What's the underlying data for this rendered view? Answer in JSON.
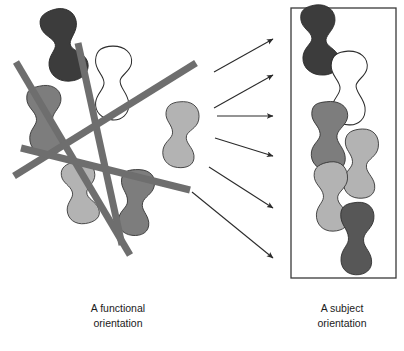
{
  "figure": {
    "type": "conceptual-diagram",
    "background_color": "#ffffff",
    "description_left": "Scattered organism shapes overlaid by crossing straight lines",
    "description_right": "Same organism shapes sorted into a single vertical column inside a rectangle"
  },
  "captions": {
    "left": {
      "line1": "A functional",
      "line2": "orientation"
    },
    "right": {
      "line1": "A subject",
      "line2": "orientation"
    }
  },
  "colors": {
    "shape_darkest": "#3c3c3c",
    "shape_dark": "#575757",
    "shape_medium": "#7d7d7d",
    "shape_light": "#b3b3b3",
    "shape_white_fill": "#ffffff",
    "shape_outline": "#2b2b2b",
    "line_gray": "#6e6e6e",
    "arrow_color": "#2b2b2b",
    "box_border": "#3a3a3a",
    "text_color": "#1a1a1a",
    "background": "#ffffff"
  },
  "left_panel": {
    "name": "functional-orientation-panel",
    "crossing_lines": [
      {
        "id": "line-1",
        "x1": 16,
        "y1": 62,
        "x2": 130,
        "y2": 255,
        "width": 7
      },
      {
        "id": "line-2",
        "x1": 78,
        "y1": 43,
        "x2": 122,
        "y2": 245,
        "width": 7
      },
      {
        "id": "line-3",
        "x1": 14,
        "y1": 176,
        "x2": 196,
        "y2": 63,
        "width": 7
      },
      {
        "id": "line-4",
        "x1": 21,
        "y1": 148,
        "x2": 190,
        "y2": 190,
        "width": 7
      }
    ],
    "shapes": [
      {
        "id": "shape-left-dark-top",
        "tone": "shape_darkest",
        "cx": 64,
        "cy": 45,
        "rot": -12,
        "sx": 1.05,
        "sy": 1.15,
        "variant": "blob-a"
      },
      {
        "id": "shape-left-white",
        "tone": "shape_white_fill",
        "cx": 112,
        "cy": 83,
        "rot": 4,
        "sx": 1.0,
        "sy": 1.15,
        "variant": "blob-b"
      },
      {
        "id": "shape-left-medium-mid",
        "tone": "shape_medium",
        "cx": 45,
        "cy": 120,
        "rot": -3,
        "sx": 0.95,
        "sy": 1.1,
        "variant": "blob-c"
      },
      {
        "id": "shape-left-light-right",
        "tone": "shape_light",
        "cx": 180,
        "cy": 134,
        "rot": 6,
        "sx": 0.95,
        "sy": 1.05,
        "variant": "blob-d"
      },
      {
        "id": "shape-left-light-bot",
        "tone": "shape_light",
        "cx": 80,
        "cy": 192,
        "rot": -8,
        "sx": 0.95,
        "sy": 1.0,
        "variant": "blob-d"
      },
      {
        "id": "shape-left-medium-bot",
        "tone": "shape_medium",
        "cx": 136,
        "cy": 202,
        "rot": 7,
        "sx": 0.95,
        "sy": 1.05,
        "variant": "blob-e"
      }
    ]
  },
  "arrows": {
    "name": "transformation-arrows",
    "count": 6,
    "items": [
      {
        "id": "arrow-1",
        "x1": 214,
        "y1": 72,
        "x2": 273,
        "y2": 39
      },
      {
        "id": "arrow-2",
        "x1": 214,
        "y1": 108,
        "x2": 273,
        "y2": 75
      },
      {
        "id": "arrow-3",
        "x1": 217,
        "y1": 116,
        "x2": 273,
        "y2": 116
      },
      {
        "id": "arrow-4",
        "x1": 215,
        "y1": 138,
        "x2": 273,
        "y2": 156
      },
      {
        "id": "arrow-5",
        "x1": 209,
        "y1": 167,
        "x2": 273,
        "y2": 208
      },
      {
        "id": "arrow-6",
        "x1": 192,
        "y1": 192,
        "x2": 273,
        "y2": 258
      }
    ]
  },
  "right_panel": {
    "name": "subject-orientation-panel",
    "box": {
      "x": 291,
      "y": 8,
      "width": 105,
      "height": 270,
      "stroke_width": 1.3
    },
    "shapes": [
      {
        "id": "shape-right-darkest",
        "tone": "shape_darkest",
        "cx": 320,
        "cy": 40,
        "rot": -3,
        "sx": 1.0,
        "sy": 1.1,
        "variant": "blob-a"
      },
      {
        "id": "shape-right-white",
        "tone": "shape_white_fill",
        "cx": 348,
        "cy": 88,
        "rot": 3,
        "sx": 1.0,
        "sy": 1.15,
        "variant": "blob-b"
      },
      {
        "id": "shape-right-medium",
        "tone": "shape_medium",
        "cx": 329,
        "cy": 136,
        "rot": 2,
        "sx": 1.0,
        "sy": 1.1,
        "variant": "blob-c"
      },
      {
        "id": "shape-right-light-1",
        "tone": "shape_light",
        "cx": 360,
        "cy": 163,
        "rot": 4,
        "sx": 0.95,
        "sy": 1.1,
        "variant": "blob-d"
      },
      {
        "id": "shape-right-light-2",
        "tone": "shape_light",
        "cx": 331,
        "cy": 196,
        "rot": -2,
        "sx": 0.95,
        "sy": 1.1,
        "variant": "blob-d"
      },
      {
        "id": "shape-right-dark",
        "tone": "shape_dark",
        "cx": 357,
        "cy": 238,
        "rot": 2,
        "sx": 0.95,
        "sy": 1.15,
        "variant": "blob-e"
      }
    ]
  },
  "caption_positions": {
    "left": {
      "x": 118,
      "y1": 312,
      "y2": 327
    },
    "right": {
      "x": 342,
      "y1": 312,
      "y2": 327
    }
  }
}
